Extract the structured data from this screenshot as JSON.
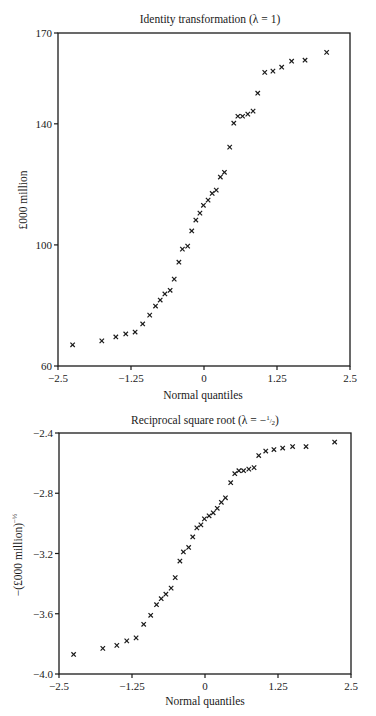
{
  "chart_data": [
    {
      "type": "scatter",
      "title": "Identity transformation (λ = 1)",
      "xlabel": "Normal quantiles",
      "ylabel": "£000 million",
      "xlim": [
        -2.5,
        2.5
      ],
      "ylim": [
        60,
        170
      ],
      "xticks": [
        -2.5,
        -1.25,
        0,
        1.25,
        2.5
      ],
      "xtick_labels": [
        "−2.5",
        "−1.25",
        "0",
        "1.25",
        "2.5"
      ],
      "yticks": [
        60,
        100,
        140,
        170
      ],
      "ytick_labels": [
        "60",
        "100",
        "140",
        "170"
      ],
      "grid": false,
      "marker": "x",
      "x": [
        -2.25,
        -1.75,
        -1.51,
        -1.34,
        -1.18,
        -1.05,
        -0.93,
        -0.83,
        -0.75,
        -0.67,
        -0.58,
        -0.51,
        -0.43,
        -0.37,
        -0.28,
        -0.21,
        -0.14,
        -0.07,
        -0.01,
        0.07,
        0.14,
        0.21,
        0.28,
        0.35,
        0.44,
        0.51,
        0.58,
        0.66,
        0.75,
        0.84,
        0.92,
        1.04,
        1.18,
        1.33,
        1.5,
        1.73,
        2.1
      ],
      "y": [
        67.0,
        68.3,
        69.6,
        70.6,
        71.2,
        73.9,
        76.8,
        79.8,
        81.8,
        83.8,
        85.0,
        88.7,
        94.3,
        98.6,
        99.6,
        104.6,
        108.2,
        110.5,
        113.1,
        114.8,
        117.0,
        118.1,
        122.4,
        124.0,
        132.3,
        140.2,
        142.5,
        142.5,
        143.2,
        144.2,
        150.1,
        157.0,
        157.4,
        158.7,
        160.7,
        161.0,
        163.6
      ]
    },
    {
      "type": "scatter",
      "title": "Reciprocal square root (λ = −½)",
      "xlabel": "Normal quantiles",
      "ylabel": "−(£000 million)^−½",
      "xlim": [
        -2.5,
        2.5
      ],
      "ylim": [
        -4.0,
        -2.4
      ],
      "xticks": [
        -2.5,
        -1.25,
        0,
        1.25,
        2.5
      ],
      "xtick_labels": [
        "−2.5",
        "−1.25",
        "0",
        "1.25",
        "2.5"
      ],
      "yticks": [
        -4.0,
        -3.6,
        -3.2,
        -2.8,
        -2.4
      ],
      "ytick_labels": [
        "−4.0",
        "−3.6",
        "−3.2",
        "−2.8",
        "−2.4"
      ],
      "grid": false,
      "marker": "x",
      "x": [
        -2.25,
        -1.75,
        -1.51,
        -1.34,
        -1.18,
        -1.05,
        -0.93,
        -0.83,
        -0.75,
        -0.67,
        -0.58,
        -0.51,
        -0.43,
        -0.37,
        -0.28,
        -0.21,
        -0.14,
        -0.07,
        -0.01,
        0.07,
        0.14,
        0.21,
        0.28,
        0.35,
        0.44,
        0.51,
        0.58,
        0.66,
        0.75,
        0.84,
        0.92,
        1.04,
        1.18,
        1.33,
        1.5,
        1.73,
        2.22
      ],
      "y": [
        -3.87,
        -3.83,
        -3.81,
        -3.78,
        -3.76,
        -3.67,
        -3.61,
        -3.54,
        -3.5,
        -3.47,
        -3.43,
        -3.36,
        -3.25,
        -3.19,
        -3.16,
        -3.09,
        -3.03,
        -3.01,
        -2.97,
        -2.95,
        -2.93,
        -2.9,
        -2.86,
        -2.83,
        -2.73,
        -2.67,
        -2.65,
        -2.65,
        -2.64,
        -2.63,
        -2.55,
        -2.52,
        -2.51,
        -2.5,
        -2.49,
        -2.49,
        -2.46
      ]
    }
  ],
  "charts": {
    "top": {
      "title": "Identity transformation (λ = 1)",
      "xlabel": "Normal quantiles",
      "ylabel": "£000 million"
    },
    "bottom": {
      "title_main": "Reciprocal square root (λ = −",
      "title_frac_num": "1",
      "title_frac_den": "2",
      "title_end": ")",
      "xlabel": "Normal quantiles",
      "ylabel_main": "−(£000 million)",
      "ylabel_exp": "−½"
    }
  }
}
